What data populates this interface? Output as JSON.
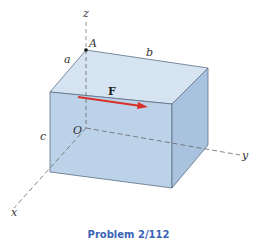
{
  "figure": {
    "caption": "Problem 2/112",
    "colors": {
      "box_top": "#d6e4f1",
      "box_front": "#bcd2e8",
      "box_right": "#a9c3de",
      "edge": "#5c6f85",
      "axis": "#777777",
      "force": "#d9302a",
      "caption": "#3a64b8"
    },
    "axes": {
      "x": "x",
      "y": "y",
      "z": "z"
    },
    "points": {
      "origin": "O",
      "corner": "A"
    },
    "dimensions": {
      "a": "a",
      "b": "b",
      "c": "c"
    },
    "force": {
      "label": "F"
    }
  }
}
